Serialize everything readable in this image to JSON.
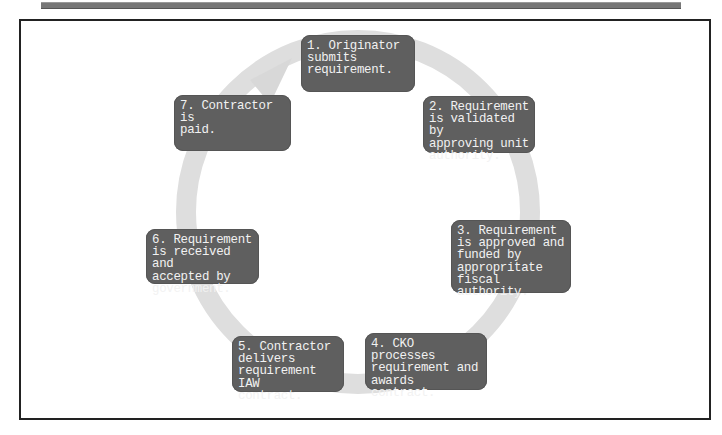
{
  "diagram": {
    "type": "cycle",
    "colors": {
      "box_fill": "#5f5f5f",
      "box_text": "#f2f2f2",
      "arrow": "#dcdcdc",
      "frame": "#222222"
    },
    "steps": [
      {
        "id": 1,
        "text": "1. Originator\nsubmits\nrequirement."
      },
      {
        "id": 2,
        "text": "2. Requirement\nis validated by\napproving unit\nauthority."
      },
      {
        "id": 3,
        "text": "3. Requirement\nis approved and\nfunded by\nappropritate\nfiscal\nauthority."
      },
      {
        "id": 4,
        "text": "4. CKO processes\nrequirement and\nawards contract."
      },
      {
        "id": 5,
        "text": "5. Contractor\ndelivers\nrequirement IAW\ncontract."
      },
      {
        "id": 6,
        "text": "6. Requirement\nis received and\naccepted by\ngovernment."
      },
      {
        "id": 7,
        "text": "7. Contractor is\npaid."
      }
    ]
  }
}
